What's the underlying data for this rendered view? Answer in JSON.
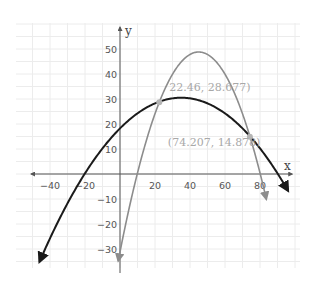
{
  "chart_data": {
    "type": "line",
    "title": "",
    "xlabel": "x",
    "ylabel": "y",
    "xlim": [
      -52,
      95
    ],
    "ylim": [
      -38,
      58
    ],
    "grid": true,
    "x_ticks": [
      -40,
      -20,
      20,
      40,
      60,
      80
    ],
    "y_ticks": [
      -30,
      -20,
      -10,
      10,
      20,
      30,
      40,
      50
    ],
    "x_tick_labels": [
      "−40",
      "−20",
      "20",
      "40",
      "60",
      "80"
    ],
    "y_tick_labels": [
      "−30",
      "−20",
      "−10",
      "10",
      "20",
      "30",
      "40",
      "50"
    ],
    "series": [
      {
        "name": "black parabola",
        "color": "#1a1a1a",
        "form": "vertex",
        "a": -0.01,
        "h": 35,
        "k": 30.5,
        "x_range": [
          -46,
          96
        ]
      },
      {
        "name": "gray parabola",
        "color": "#8c8c8c",
        "form": "vertex",
        "a": -0.0395,
        "h": 45,
        "k": 48.8,
        "x_range": [
          -1,
          83.6
        ]
      }
    ],
    "points": [
      {
        "x": 22.46,
        "y": 28.677,
        "label": "22.46, 28.677)"
      },
      {
        "x": 74.207,
        "y": 14.878,
        "label": "(74.207, 14.878)"
      }
    ]
  }
}
